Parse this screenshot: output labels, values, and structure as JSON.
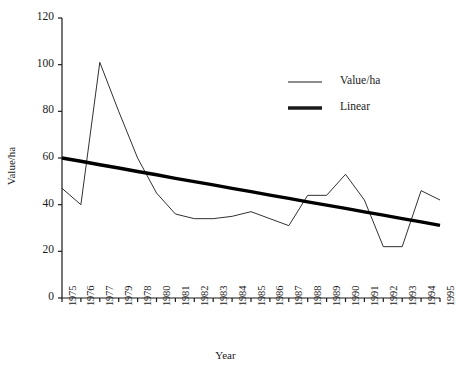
{
  "chart_data": {
    "type": "line",
    "title": "",
    "xlabel": "Year",
    "ylabel": "Value/ha",
    "xlim": [
      0,
      20
    ],
    "ylim": [
      0,
      120
    ],
    "grid": false,
    "legend_position": "top-right",
    "categories": [
      "1975",
      "1976",
      "1977",
      "1979",
      "1978",
      "1980",
      "1981",
      "1982",
      "1983",
      "1984",
      "1985",
      "1986",
      "1987",
      "1988",
      "1989",
      "1990",
      "1991",
      "1992",
      "1993",
      "1994",
      "1995"
    ],
    "x_tick_labels": [
      "1975",
      "1976",
      "1977",
      "1979",
      "1978",
      "1980",
      "1981",
      "1982",
      "1983",
      "1984",
      "1985",
      "1986",
      "1987",
      "1988",
      "1989",
      "1990",
      "1991",
      "1992",
      "1993",
      "1994",
      "1995"
    ],
    "y_tick_labels": [
      "0",
      "20",
      "40",
      "60",
      "80",
      "100",
      "120"
    ],
    "y_ticks": [
      0,
      20,
      40,
      60,
      80,
      100,
      120
    ],
    "series": [
      {
        "name": "Value/ha",
        "style": "thin",
        "color": "#1a1a1a",
        "values": [
          47,
          40,
          101,
          80,
          60,
          45,
          36,
          34,
          34,
          35,
          37,
          34,
          31,
          44,
          44,
          53,
          42,
          22,
          22,
          46,
          42
        ]
      },
      {
        "name": "Linear",
        "style": "thick",
        "color": "#000000",
        "values": [
          60,
          58.6,
          57.1,
          55.7,
          54.2,
          52.8,
          51.3,
          49.9,
          48.5,
          47.0,
          45.6,
          44.1,
          42.7,
          41.2,
          39.8,
          38.4,
          36.9,
          35.5,
          34.0,
          32.6,
          31.1
        ]
      }
    ],
    "legend": [
      {
        "label": "Value/ha",
        "style": "thin"
      },
      {
        "label": "Linear",
        "style": "thick"
      }
    ]
  }
}
